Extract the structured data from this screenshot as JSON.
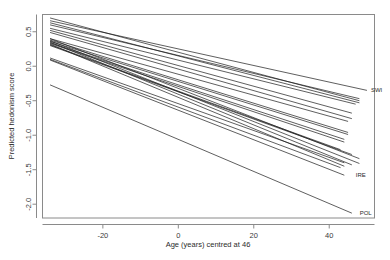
{
  "chart_data": {
    "type": "line",
    "title": "",
    "xlabel": "Age (years) centred at 46",
    "ylabel": "Predicted hedonism score",
    "xlim": [
      -36,
      52
    ],
    "ylim": [
      -2.2,
      0.75
    ],
    "xticks": [
      -20,
      0,
      20,
      40
    ],
    "xtick_labels": [
      "-20",
      "0",
      "20",
      "40"
    ],
    "yticks": [
      0.5,
      0.0,
      -0.5,
      -1.0,
      -1.5,
      -2.0
    ],
    "ytick_labels": [
      "0.5",
      "0.0",
      "-0.5",
      "-1.0",
      "-1.5",
      "-2.0"
    ],
    "grid": false,
    "legend": "none",
    "annotations": [
      {
        "text": "SWI",
        "x": 50,
        "y": -0.35
      },
      {
        "text": "IRE",
        "x": 46,
        "y": -1.58
      },
      {
        "text": "POL",
        "x": 47,
        "y": -2.13
      }
    ],
    "series": [
      {
        "name": "SWI",
        "x": [
          -34,
          50
        ],
        "values": [
          0.66,
          -0.35
        ],
        "labeled": true
      },
      {
        "name": "line2",
        "x": [
          -34,
          48
        ],
        "values": [
          0.7,
          -0.5
        ],
        "labeled": false
      },
      {
        "name": "line3",
        "x": [
          -34,
          48
        ],
        "values": [
          0.63,
          -0.53
        ],
        "labeled": false
      },
      {
        "name": "line4",
        "x": [
          -34,
          48
        ],
        "values": [
          0.6,
          -0.47
        ],
        "labeled": false
      },
      {
        "name": "line5",
        "x": [
          -34,
          47
        ],
        "values": [
          0.55,
          -0.55
        ],
        "labeled": false
      },
      {
        "name": "line6",
        "x": [
          -34,
          46
        ],
        "values": [
          0.52,
          -0.68
        ],
        "labeled": false
      },
      {
        "name": "line7",
        "x": [
          -34,
          46
        ],
        "values": [
          0.49,
          -0.76
        ],
        "labeled": false
      },
      {
        "name": "line8",
        "x": [
          -34,
          45
        ],
        "values": [
          0.4,
          -0.8
        ],
        "labeled": false
      },
      {
        "name": "line9",
        "x": [
          -34,
          45
        ],
        "values": [
          0.38,
          -0.96
        ],
        "labeled": false
      },
      {
        "name": "line10",
        "x": [
          -34,
          45
        ],
        "values": [
          0.36,
          -0.99
        ],
        "labeled": false
      },
      {
        "name": "line11",
        "x": [
          -34,
          44
        ],
        "values": [
          0.34,
          -1.06
        ],
        "labeled": false
      },
      {
        "name": "line12",
        "x": [
          -34,
          44
        ],
        "values": [
          0.33,
          -1.1
        ],
        "labeled": false
      },
      {
        "name": "line13",
        "x": [
          -34,
          43
        ],
        "values": [
          0.31,
          -1.21
        ],
        "labeled": false
      },
      {
        "name": "line14",
        "x": [
          -34,
          46
        ],
        "values": [
          0.3,
          -1.28
        ],
        "labeled": false
      },
      {
        "name": "line15",
        "x": [
          -34,
          48
        ],
        "values": [
          0.4,
          -1.34
        ],
        "labeled": false
      },
      {
        "name": "line16",
        "x": [
          -34,
          48
        ],
        "values": [
          0.37,
          -1.41
        ],
        "labeled": false
      },
      {
        "name": "line17",
        "x": [
          -34,
          46
        ],
        "values": [
          0.35,
          -1.43
        ],
        "labeled": false
      },
      {
        "name": "line18",
        "x": [
          -34,
          44
        ],
        "values": [
          0.32,
          -1.45
        ],
        "labeled": false
      },
      {
        "name": "line19",
        "x": [
          -34,
          44
        ],
        "values": [
          0.12,
          -1.4
        ],
        "labeled": false
      },
      {
        "name": "line20",
        "x": [
          -34,
          43
        ],
        "values": [
          0.1,
          -1.47
        ],
        "labeled": false
      },
      {
        "name": "IRE",
        "x": [
          -34,
          44
        ],
        "values": [
          0.09,
          -1.58
        ],
        "labeled": true
      },
      {
        "name": "POL",
        "x": [
          -34,
          46
        ],
        "values": [
          -0.27,
          -2.13
        ],
        "labeled": true
      }
    ]
  }
}
